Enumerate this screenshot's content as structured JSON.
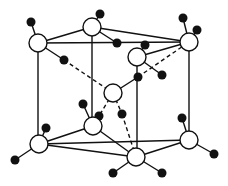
{
  "diagram": {
    "title": "",
    "type": "crystal-structure-unit-cell",
    "colors": {
      "line": "#111111",
      "white_atom_fill": "#ffffff",
      "black_atom_fill": "#111111",
      "background": "#ffffff"
    },
    "white_atoms": [
      {
        "id": "top-left",
        "x": 38,
        "y": 43,
        "r": 9
      },
      {
        "id": "top-back",
        "x": 92,
        "y": 27,
        "r": 9
      },
      {
        "id": "top-right",
        "x": 189,
        "y": 42,
        "r": 9
      },
      {
        "id": "top-front",
        "x": 137,
        "y": 57,
        "r": 9
      },
      {
        "id": "center",
        "x": 113,
        "y": 93,
        "r": 9
      },
      {
        "id": "bottom-left",
        "x": 39,
        "y": 144,
        "r": 9
      },
      {
        "id": "bottom-back",
        "x": 93,
        "y": 126,
        "r": 9
      },
      {
        "id": "bottom-right",
        "x": 189,
        "y": 140,
        "r": 9
      },
      {
        "id": "bottom-front",
        "x": 136,
        "y": 157,
        "r": 9
      }
    ],
    "black_atoms": [
      {
        "id": "b1",
        "x": 31,
        "y": 22,
        "r": 4.5
      },
      {
        "id": "b2",
        "x": 64,
        "y": 60,
        "r": 4.5
      },
      {
        "id": "b3",
        "x": 100,
        "y": 14,
        "r": 4.5
      },
      {
        "id": "b4",
        "x": 117,
        "y": 43,
        "r": 4.5
      },
      {
        "id": "b5",
        "x": 183,
        "y": 18,
        "r": 4.5
      },
      {
        "id": "b6",
        "x": 197,
        "y": 30,
        "r": 4.5
      },
      {
        "id": "b7",
        "x": 145,
        "y": 45,
        "r": 4.5
      },
      {
        "id": "b8",
        "x": 138,
        "y": 77,
        "r": 4.5
      },
      {
        "id": "b9",
        "x": 162,
        "y": 75,
        "r": 4.5
      },
      {
        "id": "b10",
        "x": 46,
        "y": 128,
        "r": 4.5
      },
      {
        "id": "b11",
        "x": 15,
        "y": 160,
        "r": 4.5
      },
      {
        "id": "b12",
        "x": 83,
        "y": 104,
        "r": 4.5
      },
      {
        "id": "b13",
        "x": 99,
        "y": 116,
        "r": 4.5
      },
      {
        "id": "b14",
        "x": 122,
        "y": 114,
        "r": 4.5
      },
      {
        "id": "b15",
        "x": 182,
        "y": 118,
        "r": 4.5
      },
      {
        "id": "b16",
        "x": 214,
        "y": 154,
        "r": 4.5
      },
      {
        "id": "b17",
        "x": 113,
        "y": 173,
        "r": 4.5
      },
      {
        "id": "b18",
        "x": 162,
        "y": 173,
        "r": 4.5
      }
    ],
    "solid_bonds": [
      [
        38,
        43,
        92,
        27
      ],
      [
        38,
        43,
        189,
        42
      ],
      [
        92,
        27,
        189,
        42
      ],
      [
        137,
        57,
        189,
        42
      ],
      [
        38,
        43,
        38,
        144
      ],
      [
        92,
        27,
        92,
        126
      ],
      [
        189,
        42,
        189,
        140
      ],
      [
        39,
        144,
        93,
        126
      ],
      [
        39,
        144,
        189,
        140
      ],
      [
        93,
        126,
        136,
        157
      ],
      [
        136,
        157,
        189,
        140
      ],
      [
        39,
        144,
        136,
        157
      ],
      [
        38,
        43,
        31,
        22
      ],
      [
        38,
        43,
        64,
        60
      ],
      [
        92,
        27,
        100,
        14
      ],
      [
        92,
        27,
        117,
        43
      ],
      [
        189,
        42,
        183,
        18
      ],
      [
        189,
        42,
        197,
        30
      ],
      [
        137,
        57,
        145,
        45
      ],
      [
        137,
        57,
        162,
        75
      ],
      [
        113,
        93,
        138,
        77
      ],
      [
        137,
        57,
        137,
        157
      ],
      [
        39,
        144,
        46,
        128
      ],
      [
        39,
        144,
        15,
        160
      ],
      [
        93,
        126,
        83,
        104
      ],
      [
        93,
        126,
        99,
        116
      ],
      [
        189,
        140,
        182,
        118
      ],
      [
        189,
        140,
        214,
        154
      ],
      [
        136,
        157,
        113,
        173
      ],
      [
        136,
        157,
        162,
        173
      ]
    ],
    "dashed_bonds": [
      [
        64,
        60,
        113,
        93
      ],
      [
        138,
        77,
        189,
        42
      ],
      [
        113,
        93,
        99,
        116
      ],
      [
        113,
        93,
        122,
        114
      ],
      [
        122,
        114,
        136,
        157
      ]
    ]
  }
}
